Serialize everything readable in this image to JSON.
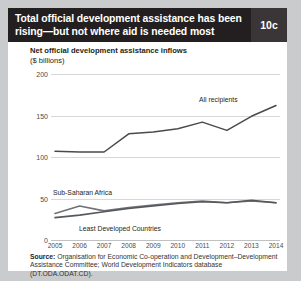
{
  "header": {
    "title": "Total official development assistance has been rising—but not where aid is needed most",
    "badge": "10c"
  },
  "subtitle": {
    "line1": "Net official development assistance inflows",
    "line2": "($ billions)"
  },
  "source": {
    "label": "Source:",
    "text": " Organisation for Economic Co-operation and Development–Development Assistance Committee; World Development Indicators database (DT.ODA.ODAT.CD)."
  },
  "colors": {
    "header_bg": "#231f20",
    "badge_bg": "#3a3637",
    "card_bg": "#ffffff",
    "page_bg": "#c9cbcd",
    "grid": "#d7d8da",
    "line_all_recipients": "#4a4a4a",
    "line_sub_saharan_africa": "#6f7276",
    "line_least_developed": "#55585c"
  },
  "chart_data": {
    "type": "line",
    "title": "Net official development assistance inflows",
    "xlabel": "",
    "ylabel": "$ billions",
    "ylim": [
      0,
      200
    ],
    "yticks": [
      0,
      50,
      100,
      150,
      200
    ],
    "grid": true,
    "legend": "inline-labels",
    "x": [
      2005,
      2006,
      2007,
      2008,
      2009,
      2010,
      2011,
      2012,
      2013,
      2014
    ],
    "categories": [
      "2005",
      "2006",
      "2007",
      "2008",
      "2009",
      "2010",
      "2011",
      "2012",
      "2013",
      "2014"
    ],
    "series": [
      {
        "name": "All recipients",
        "values": [
          107,
          106,
          106,
          128,
          130,
          134,
          142,
          132,
          149,
          162
        ]
      },
      {
        "name": "Sub-Saharan Africa",
        "values": [
          32,
          41,
          35,
          39,
          42,
          45,
          47,
          45,
          47,
          45
        ]
      },
      {
        "name": "Least Developed Countries",
        "values": [
          27,
          30,
          34,
          38,
          41,
          44,
          46,
          45,
          48,
          45
        ]
      }
    ]
  }
}
